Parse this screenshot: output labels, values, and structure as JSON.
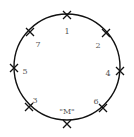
{
  "diagram": {
    "type": "circle-with-marked-points",
    "circle": {
      "cx": 67,
      "cy": 67,
      "r": 53,
      "stroke": "#111111"
    },
    "markers": [
      {
        "label": "1",
        "x": 67,
        "y": 15,
        "lx": 67,
        "ly": 32
      },
      {
        "label": "2",
        "x": 106,
        "y": 33,
        "lx": 98,
        "ly": 46
      },
      {
        "label": "4",
        "x": 120,
        "y": 71,
        "lx": 108,
        "ly": 74
      },
      {
        "label": "6",
        "x": 103,
        "y": 108,
        "lx": 96,
        "ly": 102
      },
      {
        "label": "\"M\"",
        "x": 67,
        "y": 124,
        "lx": 67,
        "ly": 112
      },
      {
        "label": "3",
        "x": 29,
        "y": 107,
        "lx": 35,
        "ly": 101
      },
      {
        "label": "5",
        "x": 14,
        "y": 68,
        "lx": 25,
        "ly": 72
      },
      {
        "label": "7",
        "x": 30,
        "y": 32,
        "lx": 38,
        "ly": 45
      }
    ]
  }
}
